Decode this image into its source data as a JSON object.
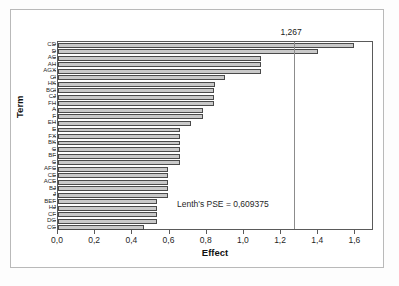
{
  "chart_data": {
    "type": "bar",
    "orientation": "horizontal",
    "title": "",
    "xlabel": "Effect",
    "ylabel": "Term",
    "xlim": [
      0.0,
      1.7
    ],
    "ylim": null,
    "grid": false,
    "legend": null,
    "decimal_separator": ",",
    "xticks": [
      "0,0",
      "0,2",
      "0,4",
      "0,6",
      "0,8",
      "1,0",
      "1,2",
      "1,4",
      "1,6"
    ],
    "xtick_values": [
      0.0,
      0.2,
      0.4,
      0.6,
      0.8,
      1.0,
      1.2,
      1.4,
      1.6
    ],
    "categories": [
      "CD",
      "D",
      "AC",
      "AH",
      "AGX",
      "CI",
      "HK",
      "BCI",
      "CJ",
      "FH",
      "A",
      "F",
      "EH",
      "E",
      "FX",
      "BK",
      "C",
      "BF",
      "C",
      "AFC",
      "CE",
      "ACE",
      "BJ",
      "J",
      "BEF",
      "HJ",
      "CF",
      "DG",
      "CG"
    ],
    "values": [
      1.59,
      1.4,
      1.09,
      1.09,
      1.09,
      0.9,
      0.845,
      0.84,
      0.84,
      0.84,
      0.78,
      0.78,
      0.715,
      0.655,
      0.655,
      0.655,
      0.655,
      0.655,
      0.655,
      0.59,
      0.59,
      0.59,
      0.59,
      0.59,
      0.535,
      0.535,
      0.535,
      0.535,
      0.465
    ],
    "reference_line": {
      "value": 1.267,
      "label": "1,267"
    },
    "annotations": [
      {
        "text": "Lenth's PSE = 0,609375",
        "x": 0.66,
        "y": "lower-middle"
      }
    ],
    "bar_fill_color": "#c9c9c9",
    "bar_edge_color": "#4a4a4a",
    "axis_color": "#5a5a5a"
  },
  "axis": {
    "x_title": "Effect",
    "y_title": "Term"
  }
}
